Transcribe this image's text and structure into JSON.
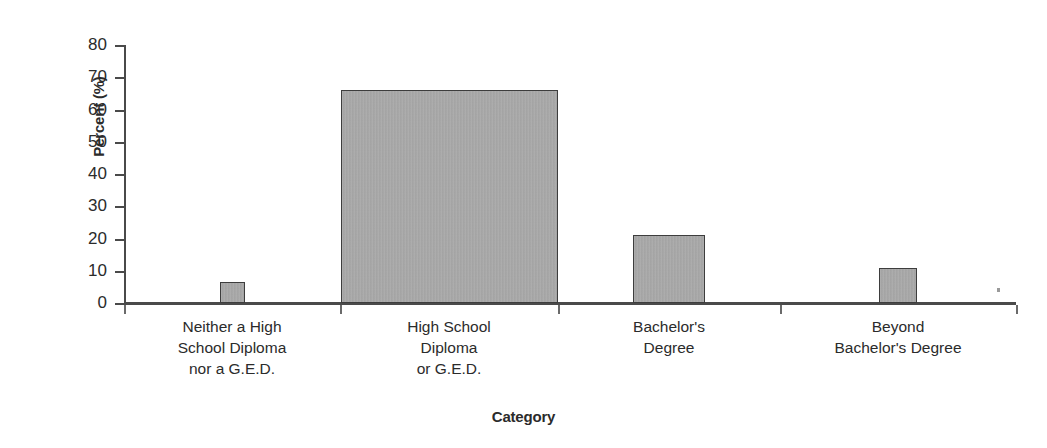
{
  "chart_data": {
    "type": "bar",
    "title": "",
    "xlabel": "Category",
    "ylabel": "Percent (%)",
    "ylim": [
      0,
      80
    ],
    "yticks": [
      0,
      10,
      20,
      30,
      40,
      50,
      60,
      70,
      80
    ],
    "grid": false,
    "legend": null,
    "categories": [
      "Neither a High School Diploma nor a G.E.D.",
      "High School Diploma or G.E.D.",
      "Bachelor's Degree",
      "Beyond Bachelor's Degree"
    ],
    "category_label_lines": [
      [
        "Neither a High",
        "School Diploma",
        "nor a G.E.D."
      ],
      [
        "High School",
        "Diploma",
        "or G.E.D."
      ],
      [
        "Bachelor's",
        "Degree"
      ],
      [
        "Beyond",
        "Bachelor's Degree"
      ]
    ],
    "values": [
      6.5,
      66,
      21,
      11
    ],
    "bar_color": "#a9a9a9",
    "bar_outline_color": "#3d3d3d",
    "axis_color": "#4a4a4a"
  },
  "axes": {
    "y_title": "Percent (%)",
    "x_title": "Category",
    "y_tick_labels": [
      "80",
      "70",
      "60",
      "50",
      "40",
      "30",
      "20",
      "10",
      "0"
    ]
  }
}
